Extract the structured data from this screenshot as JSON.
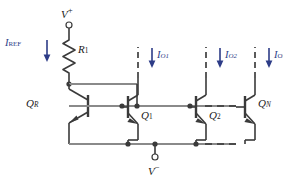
{
  "figure": {
    "background": "#ffffff",
    "wire_color": "#3a3a3a",
    "dash_color": "#4a4a4a",
    "label_color": "#1a1a1a",
    "current_color": "#2d3c87",
    "width": 283,
    "height": 177
  },
  "supplies": {
    "positive": {
      "name": "V-plus",
      "label": "V",
      "sign": "+"
    },
    "negative": {
      "name": "V-minus",
      "label": "V",
      "sign": "−"
    }
  },
  "components": {
    "resistor": {
      "label": "R",
      "subscript": "1"
    },
    "transistors": [
      {
        "label": "Q",
        "subscript": "R",
        "role": "reference-diode-connected"
      },
      {
        "label": "Q",
        "subscript": "1",
        "role": "output"
      },
      {
        "label": "Q",
        "subscript": "2",
        "role": "output"
      },
      {
        "label": "Q",
        "subscript": "N",
        "role": "output"
      }
    ]
  },
  "currents": [
    {
      "name": "reference-current",
      "label": "I",
      "subscript": "REF",
      "direction": "down"
    },
    {
      "name": "output-current-1",
      "label": "I",
      "subscript": "O1",
      "direction": "down"
    },
    {
      "name": "output-current-2",
      "label": "I",
      "subscript": "O2",
      "direction": "down"
    },
    {
      "name": "output-current-n",
      "label": "I",
      "subscript": "ON",
      "direction": "down"
    }
  ],
  "continuation": {
    "name": "ellipsis-dashes",
    "meaning": "additional identical output stages"
  }
}
